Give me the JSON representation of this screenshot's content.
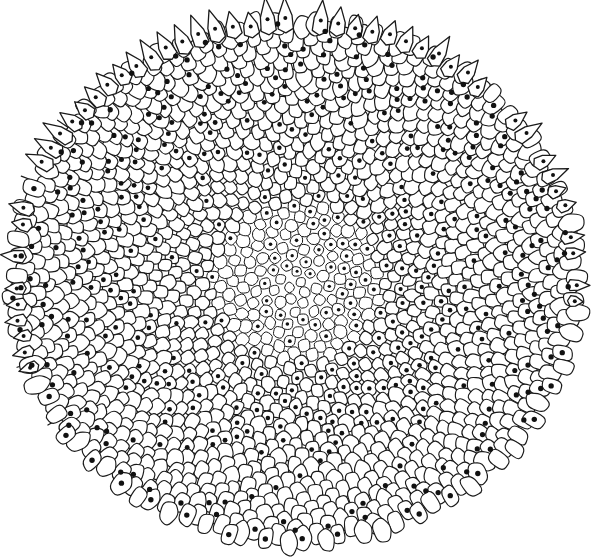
{
  "figure": {
    "caption": "",
    "width": 600,
    "height": 558,
    "background_color": "#ffffff",
    "ink_color": "#1a1a1a",
    "dot_color": "#111111"
  },
  "chart_data": {
    "type": "scatter",
    "title": "",
    "subtitle": "",
    "xlabel": "",
    "ylabel": "",
    "grid": false,
    "legend": null,
    "model": "vogel-golden-angle",
    "divergence_angle_deg": 137.508,
    "floret_count": 1480,
    "center_x": 296,
    "center_y": 282,
    "radius_x": 284,
    "radius_y": 262,
    "ellipse_ratio": 0.922,
    "radial_exponent": 0.5,
    "parastichy_families": [
      21,
      34,
      55
    ],
    "cell_scale_inner": 0.52,
    "cell_scale_outer": 1.0,
    "dotted_fraction": 0.2,
    "bract_count": 64,
    "bract_arc_start_deg": 150,
    "bract_arc_end_deg": 375,
    "bristle_count": 7,
    "xlim": [
      0,
      600
    ],
    "ylim": [
      0,
      558
    ]
  },
  "elements": {
    "diagram_name": "capitulum-phyllotaxis",
    "cell_layer_name": "floret-cells",
    "dot_layer_name": "floret-dots",
    "bract_layer_name": "involucral-bracts",
    "bristle_layer_name": "marginal-bristles"
  }
}
